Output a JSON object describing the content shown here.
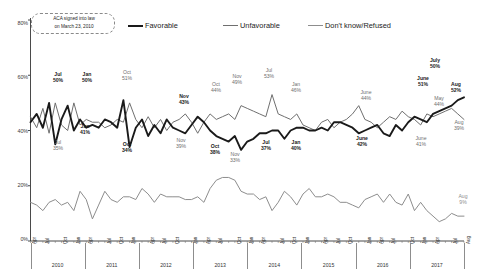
{
  "chart_data": {
    "type": "line",
    "title": "",
    "xlabel": "",
    "ylabel": "",
    "ylim": [
      0,
      80
    ],
    "ytick_labels": [
      "0%",
      "20%",
      "40%",
      "60%",
      "80%"
    ],
    "yticks": [
      0,
      20,
      40,
      60,
      80
    ],
    "grid": false,
    "legend_position": "top",
    "annotation": "ACA signed into law on March 23, 2010",
    "x_month_labels": [
      "Apr",
      "Jul",
      "Oct",
      "Jan",
      "Apr",
      "Jul",
      "Oct",
      "Jan",
      "Apr",
      "Jul",
      "Oct",
      "Jan",
      "Apr",
      "Jul",
      "Oct",
      "Jan",
      "Apr",
      "Jul",
      "Oct",
      "Jan",
      "Apr",
      "Jul",
      "Oct",
      "Jan",
      "Apr",
      "Jul",
      "Oct",
      "Jan",
      "Apr",
      "Jul",
      "Aug"
    ],
    "x_year_groups": [
      "2010",
      "2011",
      "2012",
      "2013",
      "2014",
      "2015",
      "2016",
      "2017"
    ],
    "series": [
      {
        "name": "Favorable",
        "color": "#1a1a1a",
        "width": 1.9,
        "values": [
          43,
          46,
          41,
          50,
          35,
          44,
          49,
          40,
          44,
          41,
          42,
          41,
          44,
          43,
          41,
          51,
          34,
          41,
          44,
          38,
          42,
          39,
          44,
          41,
          40,
          39,
          42,
          45,
          43,
          40,
          38,
          37,
          36,
          38,
          33,
          36,
          37,
          39,
          39,
          40,
          40,
          37,
          40,
          41,
          41,
          40,
          40,
          41,
          40,
          43,
          43,
          42,
          41,
          39,
          40,
          41,
          42,
          39,
          38,
          42,
          40,
          43,
          45,
          44,
          43,
          46,
          47,
          48,
          49,
          51,
          52
        ]
      },
      {
        "name": "Unfavorable",
        "color": "#6f6f6f",
        "width": 1.0,
        "values": [
          45,
          41,
          48,
          39,
          50,
          42,
          40,
          50,
          42,
          44,
          43,
          43,
          41,
          42,
          44,
          43,
          50,
          44,
          41,
          45,
          41,
          44,
          40,
          43,
          44,
          46,
          43,
          39,
          43,
          46,
          44,
          45,
          46,
          44,
          49,
          48,
          47,
          46,
          45,
          53,
          46,
          45,
          44,
          46,
          42,
          41,
          40,
          43,
          44,
          41,
          43,
          44,
          46,
          49,
          44,
          43,
          41,
          43,
          45,
          44,
          47,
          45,
          44,
          42,
          46,
          45,
          46,
          47,
          48,
          46,
          44
        ]
      },
      {
        "name": "Don't know/Refused",
        "color": "#8d8d8d",
        "width": 1.0,
        "values": [
          14,
          13,
          11,
          14,
          15,
          13,
          14,
          11,
          18,
          15,
          8,
          13,
          18,
          15,
          14,
          16,
          16,
          15,
          19,
          17,
          14,
          17,
          16,
          16,
          16,
          15,
          15,
          16,
          14,
          19,
          22,
          23,
          23,
          22,
          18,
          17,
          17,
          15,
          16,
          11,
          14,
          18,
          16,
          13,
          17,
          19,
          16,
          16,
          17,
          16,
          14,
          14,
          13,
          12,
          15,
          16,
          17,
          14,
          17,
          14,
          13,
          17,
          11,
          14,
          11,
          9,
          7,
          8,
          10,
          9,
          9
        ]
      }
    ],
    "point_labels": [
      {
        "series": "Favorable",
        "period": "Jul",
        "value": "50%",
        "index": 3,
        "side": "above"
      },
      {
        "series": "Unfavorable",
        "period": "Jul",
        "value": "35%",
        "index": 4,
        "side": "below"
      },
      {
        "series": "Favorable",
        "period": "Jan",
        "value": "50%",
        "index": 7,
        "side": "above"
      },
      {
        "series": "Favorable",
        "period": "Jan",
        "value": "41%",
        "index": 9,
        "side": "below"
      },
      {
        "series": "Favorable",
        "period": "Oct",
        "value": "51%",
        "index": 15,
        "side": "above"
      },
      {
        "series": "Favorable",
        "period": "Oct",
        "value": "34%",
        "index": 16,
        "side": "below"
      },
      {
        "series": "Favorable",
        "period": "Nov",
        "value": "43%",
        "index": 27,
        "side": "above"
      },
      {
        "series": "Unfavorable",
        "period": "Nov",
        "value": "39%",
        "index": 29,
        "side": "below"
      },
      {
        "series": "Unfavorable",
        "period": "Oct",
        "value": "44%",
        "index": 33,
        "side": "above"
      },
      {
        "series": "Favorable",
        "period": "Oct",
        "value": "38%",
        "index": 34,
        "side": "below"
      },
      {
        "series": "Unfavorable",
        "period": "Nov",
        "value": "49%",
        "index": 35,
        "side": "above"
      },
      {
        "series": "Favorable",
        "period": "Nov",
        "value": "33%",
        "index": 34,
        "side": "below"
      },
      {
        "series": "Unfavorable",
        "period": "Jul",
        "value": "53%",
        "index": 39,
        "side": "above"
      },
      {
        "series": "Favorable",
        "period": "Jul",
        "value": "37%",
        "index": 41,
        "side": "below"
      },
      {
        "series": "Unfavorable",
        "period": "Jan",
        "value": "46%",
        "index": 44,
        "side": "above"
      },
      {
        "series": "Favorable",
        "period": "Jan",
        "value": "40%",
        "index": 44,
        "side": "below"
      },
      {
        "series": "Unfavorable",
        "period": "June",
        "value": "44%",
        "index": 57,
        "side": "above"
      },
      {
        "series": "Favorable",
        "period": "June",
        "value": "42%",
        "index": 58,
        "side": "below"
      },
      {
        "series": "Favorable",
        "period": "July",
        "value": "50%",
        "index": 67,
        "side": "above"
      },
      {
        "series": "Favorable",
        "period": "June",
        "value": "51%",
        "index": 66,
        "side": "above"
      },
      {
        "series": "Favorable",
        "period": "Aug",
        "value": "52%",
        "index": 70,
        "side": "above"
      },
      {
        "series": "Unfavorable",
        "period": "May",
        "value": "44%",
        "index": 65,
        "side": "below"
      },
      {
        "series": "Unfavorable",
        "period": "June",
        "value": "41%",
        "index": 64,
        "side": "below"
      },
      {
        "series": "Unfavorable",
        "period": "Aug",
        "value": "39%",
        "index": 70,
        "side": "below"
      },
      {
        "series": "Don't know/Refused",
        "period": "Aug",
        "value": "9%",
        "index": 70,
        "side": "above"
      }
    ]
  },
  "legend": {
    "items": [
      {
        "label": "Favorable",
        "color": "#1a1a1a"
      },
      {
        "label": "Unfavorable",
        "color": "#6f6f6f"
      },
      {
        "label": "Don't know/Refused",
        "color": "#8d8d8d"
      }
    ]
  },
  "annotation": {
    "line1": "ACA signed into law",
    "line2": "on March 23, 2010"
  },
  "axis": {
    "y_ticks": [
      "80%",
      "60%",
      "40%",
      "20%",
      "0%"
    ]
  },
  "labels": {
    "l1": {
      "period": "Jul",
      "value": "50%"
    },
    "l2": {
      "period": "Jan",
      "value": "50%"
    },
    "l3": {
      "period": "Oct",
      "value": "51%"
    },
    "l4": {
      "period": "Nov",
      "value": "43%"
    },
    "l5": {
      "period": "Oct",
      "value": "44%"
    },
    "l6": {
      "period": "Nov",
      "value": "49%"
    },
    "l7": {
      "period": "Jul",
      "value": "53%"
    },
    "l8": {
      "period": "Jan",
      "value": "46%"
    },
    "l9": {
      "period": "June",
      "value": "44%"
    },
    "l10": {
      "period": "July",
      "value": "50%"
    },
    "l11": {
      "period": "June",
      "value": "51%"
    },
    "l12": {
      "period": "Aug",
      "value": "52%"
    },
    "l13": {
      "period": "May",
      "value": "44%"
    },
    "b1": {
      "period": "Jul",
      "value": "35%"
    },
    "b2": {
      "period": "Jan",
      "value": "41%"
    },
    "b3": {
      "period": "Oct",
      "value": "34%"
    },
    "b4": {
      "period": "Nov",
      "value": "39%"
    },
    "b5": {
      "period": "Oct",
      "value": "38%"
    },
    "b6": {
      "period": "Nov",
      "value": "33%"
    },
    "b7": {
      "period": "Jul",
      "value": "37%"
    },
    "b8": {
      "period": "Jan",
      "value": "40%"
    },
    "b9": {
      "period": "June",
      "value": "42%"
    },
    "b10": {
      "period": "June",
      "value": "41%"
    },
    "b11": {
      "period": "Aug",
      "value": "39%"
    },
    "b12": {
      "period": "Aug",
      "value": "9%"
    }
  }
}
